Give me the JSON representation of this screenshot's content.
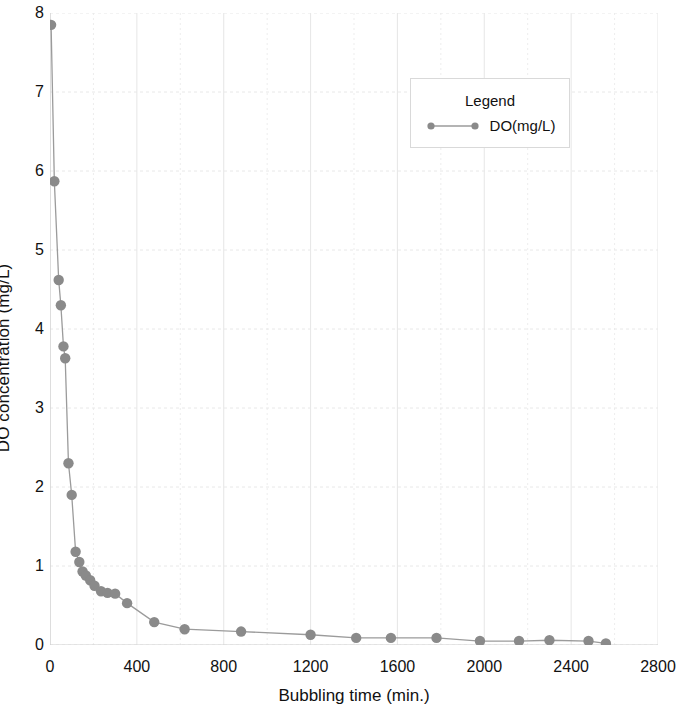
{
  "chart_data": {
    "type": "scatter",
    "title": "",
    "xlabel": "Bubbling time (min.)",
    "ylabel": "DO concentration (mg/L)",
    "xlim": [
      0,
      2800
    ],
    "ylim": [
      0,
      8
    ],
    "xticks": [
      0,
      400,
      800,
      1200,
      1600,
      2000,
      2400,
      2800
    ],
    "yticks": [
      0,
      1,
      2,
      3,
      4,
      5,
      6,
      7,
      8
    ],
    "grid": true,
    "legend_position": "upper-right",
    "legend_title": "Legend",
    "series": [
      {
        "name": "DO(mg/L)",
        "marker": "circle",
        "color": "#8a8a8a",
        "line_color": "#9b9b9b",
        "x": [
          5,
          20,
          40,
          50,
          62,
          70,
          85,
          100,
          118,
          135,
          150,
          165,
          185,
          205,
          235,
          265,
          300,
          355,
          480,
          620,
          880,
          1200,
          1410,
          1570,
          1780,
          1980,
          2160,
          2300,
          2480,
          2560
        ],
        "y": [
          7.85,
          5.87,
          4.62,
          4.3,
          3.78,
          3.63,
          2.3,
          1.9,
          1.18,
          1.05,
          0.93,
          0.88,
          0.82,
          0.75,
          0.68,
          0.66,
          0.65,
          0.53,
          0.29,
          0.2,
          0.17,
          0.13,
          0.09,
          0.09,
          0.09,
          0.05,
          0.05,
          0.06,
          0.05,
          0.02
        ]
      }
    ]
  },
  "legend": {
    "title": "Legend",
    "entry_label": "DO(mg/L)"
  },
  "axes": {
    "x_title": "Bubbling time (min.)",
    "y_title": "DO concentration (mg/L)",
    "x_tick_labels": [
      "0",
      "400",
      "800",
      "1200",
      "1600",
      "2000",
      "2400",
      "2800"
    ],
    "y_tick_labels": [
      "0",
      "1",
      "2",
      "3",
      "4",
      "5",
      "6",
      "7",
      "8"
    ]
  },
  "colors": {
    "marker": "#8a8a8a",
    "line": "#9b9b9b",
    "grid": "#e8e8e8",
    "axis": "#cfcfcf",
    "text": "#111111"
  }
}
